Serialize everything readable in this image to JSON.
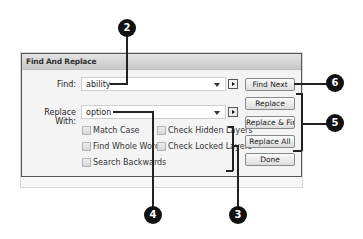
{
  "dialog": {
    "title": "Find And Replace",
    "find": {
      "label": "Find:",
      "value": "ability"
    },
    "replace": {
      "label": "Replace With:",
      "value": "option"
    },
    "options_left": [
      {
        "label": "Match Case",
        "checked": false
      },
      {
        "label": "Find Whole Word",
        "checked": false
      },
      {
        "label": "Search Backwards",
        "checked": false
      }
    ],
    "options_right": [
      {
        "label": "Check Hidden Layers",
        "checked": false
      },
      {
        "label": "Check Locked Layers",
        "checked": false
      }
    ],
    "buttons": {
      "find_next": "Find Next",
      "replace": "Replace",
      "replace_find": "Replace & Find",
      "replace_all": "Replace All",
      "done": "Done"
    }
  },
  "callouts": {
    "c2": "2",
    "c3": "3",
    "c4": "4",
    "c5": "5",
    "c6": "6"
  },
  "colors": {
    "callout": "#111111",
    "dialog_border": "#555555",
    "titlebar_top": "#e4e4e4",
    "titlebar_bottom": "#c8c8c8"
  }
}
